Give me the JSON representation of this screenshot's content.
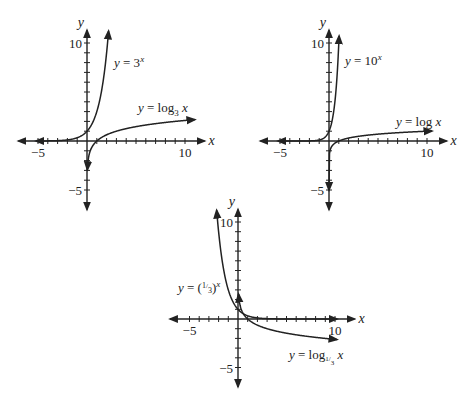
{
  "chart_data": [
    {
      "type": "line",
      "title": "",
      "xlabel": "x",
      "ylabel": "y",
      "xlim": [
        -6,
        11
      ],
      "ylim": [
        -6,
        11
      ],
      "x_tick_labels": [
        "-5",
        "10"
      ],
      "y_tick_labels": [
        "10",
        "-5"
      ],
      "grid": false,
      "series": [
        {
          "name": "y = 3^x",
          "label": "y = 3",
          "sup": "x",
          "function": "3^x"
        },
        {
          "name": "y = log_3 x",
          "label": "y = log",
          "sub": "3",
          "after": " x",
          "function": "log3(x)"
        }
      ]
    },
    {
      "type": "line",
      "title": "",
      "xlabel": "x",
      "ylabel": "y",
      "xlim": [
        -6,
        11
      ],
      "ylim": [
        -6,
        11
      ],
      "x_tick_labels": [
        "-5",
        "10"
      ],
      "y_tick_labels": [
        "10",
        "-5"
      ],
      "grid": false,
      "series": [
        {
          "name": "y = 10^x",
          "label": "y = 10",
          "sup": "x",
          "function": "10^x"
        },
        {
          "name": "y = log x",
          "label": "y = log x",
          "function": "log10(x)"
        }
      ]
    },
    {
      "type": "line",
      "title": "",
      "xlabel": "x",
      "ylabel": "y",
      "xlim": [
        -6,
        11
      ],
      "ylim": [
        -6,
        11
      ],
      "x_tick_labels": [
        "-5",
        "10"
      ],
      "y_tick_labels": [
        "10",
        "-5"
      ],
      "grid": false,
      "series": [
        {
          "name": "y = (1/3)^x",
          "label": "y = (",
          "frac": "1/3",
          "after": ")",
          "sup": "x",
          "function": "(1/3)^x"
        },
        {
          "name": "y = log_(1/3) x",
          "label": "y = log",
          "sub": "1/3",
          "after": " x",
          "function": "log_(1/3)(x)"
        }
      ]
    }
  ],
  "labels": {
    "x": "x",
    "y": "y",
    "neg5": "−5",
    "ten": "10"
  },
  "graphs": [
    {
      "eq1": "y = 3",
      "eq1_sup": "x",
      "eq2": "y = log",
      "eq2_sub": "3",
      "eq2_tail": " x"
    },
    {
      "eq1": "y = 10",
      "eq1_sup": "x",
      "eq2": "y = log x"
    },
    {
      "eq1_pre": "y = (",
      "eq1_num": "1",
      "eq1_den": "3",
      "eq1_post": ")",
      "eq1_sup": "x",
      "eq2": "y = log",
      "eq2_sub_num": "1",
      "eq2_sub_den": "3",
      "eq2_tail": " x"
    }
  ]
}
